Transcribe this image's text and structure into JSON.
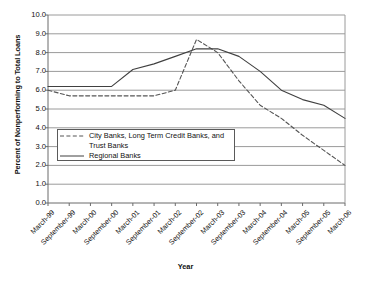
{
  "chart_data": {
    "type": "line",
    "title": "",
    "xlabel": "Year",
    "ylabel": "Percent of Nonperforming to Total Loans",
    "ylim": [
      0.0,
      10.0
    ],
    "ytick_step": 1.0,
    "yticks": [
      "10.0",
      "9.0",
      "8.0",
      "7.0",
      "6.0",
      "5.0",
      "4.0",
      "3.0",
      "2.0",
      "1.0",
      "0.0"
    ],
    "grid": "horizontal",
    "legend_position": "inside-lower-left",
    "categories": [
      "March-99",
      "September-99",
      "March-00",
      "September-00",
      "March-01",
      "September-01",
      "March-02",
      "September-02",
      "March-03",
      "September-03",
      "March-04",
      "September-04",
      "March-05",
      "September-05",
      "March-06"
    ],
    "series": [
      {
        "name": "City Banks, Long Term Credit Banks, and Trust Banks",
        "legend_line1": "City Banks, Long Term Credit Banks, and",
        "legend_line2": "Trust Banks",
        "style": "dashed",
        "color": "#555555",
        "values": [
          6.0,
          5.7,
          5.7,
          5.7,
          5.7,
          5.7,
          6.0,
          8.7,
          8.0,
          6.5,
          5.2,
          4.5,
          3.6,
          2.8,
          2.0
        ]
      },
      {
        "name": "Regional Banks",
        "legend_line1": "Regional Banks",
        "legend_line2": "",
        "style": "solid",
        "color": "#404040",
        "values": [
          6.2,
          6.2,
          6.2,
          6.2,
          7.1,
          7.4,
          7.8,
          8.2,
          8.2,
          7.8,
          7.0,
          6.0,
          5.5,
          5.2,
          4.5
        ]
      }
    ]
  }
}
